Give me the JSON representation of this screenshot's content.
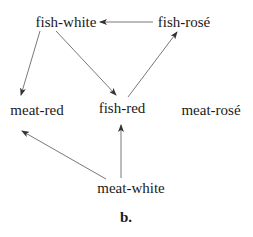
{
  "diagram": {
    "type": "directed-graph",
    "caption": "b.",
    "nodes": [
      {
        "id": "fish-white",
        "label": "fish-white",
        "x": 66,
        "y": 22
      },
      {
        "id": "fish-rose",
        "label": "fish-rosé",
        "x": 184,
        "y": 22
      },
      {
        "id": "meat-red",
        "label": "meat-red",
        "x": 37,
        "y": 110
      },
      {
        "id": "fish-red",
        "label": "fish-red",
        "x": 122,
        "y": 108
      },
      {
        "id": "meat-rose",
        "label": "meat-rosé",
        "x": 211,
        "y": 110
      },
      {
        "id": "meat-white",
        "label": "meat-white",
        "x": 131,
        "y": 188
      }
    ],
    "edges": [
      {
        "from": "fish-rose",
        "to": "fish-white"
      },
      {
        "from": "fish-white",
        "to": "meat-red"
      },
      {
        "from": "fish-white",
        "to": "fish-red"
      },
      {
        "from": "fish-red",
        "to": "fish-rose"
      },
      {
        "from": "meat-white",
        "to": "meat-red"
      },
      {
        "from": "meat-white",
        "to": "fish-red"
      }
    ],
    "colors": {
      "edge": "#555555",
      "text": "#1a1a1a",
      "background": "#ffffff"
    }
  }
}
